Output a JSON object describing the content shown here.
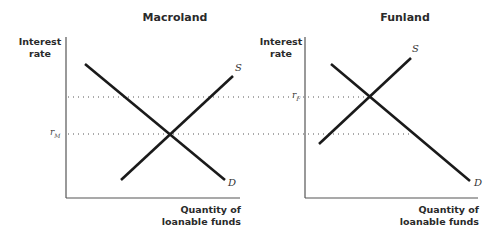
{
  "panels": [
    {
      "title": "Macroland",
      "y_axis_label_line1": "Interest",
      "y_axis_label_line2": "rate",
      "x_axis_label_line1": "Quantity of",
      "x_axis_label_line2": "loanable funds",
      "supply_label": "S",
      "demand_label": "D",
      "rate_label": "r",
      "rate_subscript": "M"
    },
    {
      "title": "Funland",
      "y_axis_label_line1": "Interest",
      "y_axis_label_line2": "rate",
      "x_axis_label_line1": "Quantity of",
      "x_axis_label_line2": "loanable funds",
      "supply_label": "S",
      "demand_label": "D",
      "rate_label": "r",
      "rate_subscript": "F"
    }
  ],
  "colors": {
    "line": "#1a1a1a",
    "axis": "#555555",
    "dotted": "#555555"
  }
}
